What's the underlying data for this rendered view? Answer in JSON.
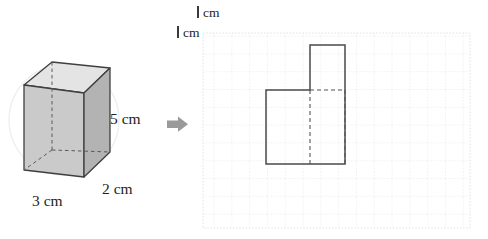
{
  "figure": {
    "arrow_icon": "arrow-right-icon"
  },
  "prism": {
    "height_label": "5 cm",
    "depth_label": "2 cm",
    "width_label": "3 cm",
    "height_value": 5,
    "depth_value": 2,
    "width_value": 3,
    "unit": "cm",
    "face_front_color": "#c9c9c9",
    "face_right_color": "#b2b2b2",
    "face_top_color": "#e3e3e3",
    "edge_color": "#3f3f3f",
    "hidden_edge_color": "#5a5a5a",
    "watermark_color": "#efefef"
  },
  "grid": {
    "unit_label_top": "1 cm",
    "unit_label_left": "1 cm",
    "unit_digit": "1",
    "unit_text": "cm",
    "cell_size_px": 17.8,
    "columns": 15,
    "rows": 11,
    "line_color": "#d8dce4",
    "background": "#ffffff"
  },
  "shape": {
    "name": "L-shaped-cross-section",
    "outline_color": "#4a4a4a",
    "dashed_color": "#555555",
    "big_rect": {
      "x": 266,
      "y": 90,
      "w": 79,
      "h": 74
    },
    "small_rect": {
      "x": 310,
      "y": 45,
      "w": 35,
      "h": 45
    },
    "dashed_segments": [
      {
        "x1": 310,
        "y1": 90,
        "x2": 345,
        "y2": 90
      },
      {
        "x1": 310,
        "y1": 90,
        "x2": 310,
        "y2": 164
      },
      {
        "x1": 345,
        "y1": 90,
        "x2": 345,
        "y2": 164
      }
    ]
  },
  "arrow": {
    "color": "#9a9a9a",
    "x": 167,
    "y": 117,
    "w": 21,
    "h": 14
  }
}
